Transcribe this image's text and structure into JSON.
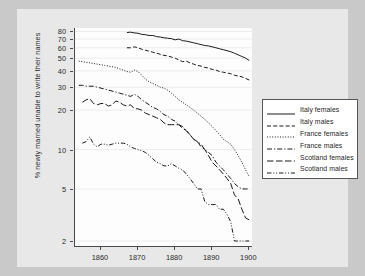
{
  "chart_data": {
    "type": "line",
    "title": "",
    "xlabel": "",
    "ylabel": "% newly married unable to write their names",
    "yscale": "log",
    "xlim": [
      1853,
      1901
    ],
    "ylim": [
      1.8,
      85
    ],
    "grid": "horizontal",
    "legend_position": "right",
    "x_ticks": [
      "1860",
      "1870",
      "1880",
      "1890",
      "1900"
    ],
    "x_tick_values": [
      1860,
      1870,
      1880,
      1890,
      1900
    ],
    "y_ticks": [
      "80",
      "70",
      "60",
      "50",
      "40",
      "30",
      "20",
      "10",
      "5",
      "2"
    ],
    "y_tick_values": [
      80,
      70,
      60,
      50,
      40,
      30,
      20,
      10,
      5,
      2
    ],
    "series": [
      {
        "name": "Italy females",
        "style": "solid",
        "x": [
          1867,
          1868,
          1869,
          1870,
          1871,
          1872,
          1873,
          1874,
          1875,
          1876,
          1877,
          1878,
          1879,
          1880,
          1881,
          1882,
          1883,
          1884,
          1885,
          1886,
          1887,
          1888,
          1889,
          1890,
          1891,
          1892,
          1893,
          1894,
          1895,
          1896,
          1897,
          1898,
          1899,
          1900
        ],
        "values": [
          78.5,
          79.0,
          78.0,
          77.5,
          76.0,
          75.5,
          74.5,
          74.5,
          73.0,
          72.5,
          71.5,
          71.0,
          70.5,
          69.0,
          70.0,
          68.0,
          67.5,
          66.5,
          65.5,
          64.5,
          63.5,
          62.5,
          62.0,
          61.0,
          60.0,
          59.0,
          58.0,
          57.0,
          56.0,
          54.5,
          53.0,
          51.5,
          50.0,
          48.0
        ]
      },
      {
        "name": "Italy males",
        "style": "dashed",
        "x": [
          1867,
          1868,
          1869,
          1870,
          1871,
          1872,
          1873,
          1874,
          1875,
          1876,
          1877,
          1878,
          1879,
          1880,
          1881,
          1882,
          1883,
          1884,
          1885,
          1886,
          1887,
          1888,
          1889,
          1890,
          1891,
          1892,
          1893,
          1894,
          1895,
          1896,
          1897,
          1898,
          1899,
          1900
        ],
        "values": [
          60.0,
          60.0,
          61.0,
          60.0,
          58.5,
          57.5,
          56.5,
          55.5,
          54.5,
          53.5,
          52.5,
          52.0,
          51.0,
          50.0,
          48.5,
          47.0,
          47.5,
          46.0,
          45.0,
          44.0,
          43.5,
          42.5,
          42.0,
          41.0,
          40.5,
          39.5,
          39.0,
          38.5,
          38.0,
          37.0,
          36.5,
          36.0,
          35.0,
          34.0
        ]
      },
      {
        "name": "France females",
        "style": "dotted",
        "x": [
          1854,
          1855,
          1856,
          1857,
          1858,
          1859,
          1860,
          1861,
          1862,
          1863,
          1864,
          1865,
          1866,
          1867,
          1868,
          1869,
          1870,
          1871,
          1872,
          1873,
          1874,
          1875,
          1876,
          1877,
          1878,
          1879,
          1880,
          1881,
          1882,
          1883,
          1884,
          1885,
          1886,
          1887,
          1888,
          1889,
          1890,
          1891,
          1892,
          1893,
          1894,
          1895,
          1896,
          1897,
          1898,
          1899,
          1900
        ],
        "values": [
          47.5,
          47.0,
          46.5,
          46.0,
          45.5,
          45.0,
          44.5,
          44.0,
          43.5,
          43.0,
          42.5,
          41.5,
          40.5,
          39.5,
          39.0,
          40.5,
          39.5,
          37.0,
          34.5,
          33.0,
          32.0,
          31.0,
          30.0,
          29.5,
          28.5,
          27.0,
          25.5,
          24.0,
          23.0,
          22.0,
          21.0,
          20.0,
          19.0,
          18.0,
          17.0,
          16.0,
          15.0,
          14.0,
          13.0,
          12.0,
          11.5,
          11.0,
          10.0,
          9.0,
          8.0,
          7.0,
          6.2
        ]
      },
      {
        "name": "France males",
        "style": "dashdot",
        "x": [
          1854,
          1855,
          1856,
          1857,
          1858,
          1859,
          1860,
          1861,
          1862,
          1863,
          1864,
          1865,
          1866,
          1867,
          1868,
          1869,
          1870,
          1871,
          1872,
          1873,
          1874,
          1875,
          1876,
          1877,
          1878,
          1879,
          1880,
          1881,
          1882,
          1883,
          1884,
          1885,
          1886,
          1887,
          1888,
          1889,
          1890,
          1891,
          1892,
          1893,
          1894,
          1895,
          1896,
          1897,
          1898,
          1899,
          1900
        ],
        "values": [
          31.0,
          31.0,
          30.5,
          30.5,
          30.5,
          30.0,
          29.5,
          29.0,
          28.5,
          28.0,
          27.5,
          27.0,
          26.5,
          26.0,
          25.5,
          26.5,
          25.5,
          24.0,
          23.0,
          22.0,
          21.0,
          20.5,
          19.5,
          18.5,
          18.0,
          17.0,
          16.5,
          15.5,
          15.0,
          14.0,
          13.0,
          12.0,
          11.5,
          11.0,
          10.0,
          9.5,
          9.0,
          8.0,
          7.5,
          7.0,
          6.5,
          6.0,
          5.5,
          5.2,
          5.0,
          5.0,
          5.0
        ]
      },
      {
        "name": "Scotland females",
        "style": "longdash",
        "x": [
          1855,
          1856,
          1857,
          1858,
          1859,
          1860,
          1861,
          1862,
          1863,
          1864,
          1865,
          1866,
          1867,
          1868,
          1869,
          1870,
          1871,
          1872,
          1873,
          1874,
          1875,
          1876,
          1877,
          1878,
          1879,
          1880,
          1881,
          1882,
          1883,
          1884,
          1885,
          1886,
          1887,
          1888,
          1889,
          1890,
          1891,
          1892,
          1893,
          1894,
          1895,
          1896,
          1897,
          1898,
          1899,
          1900
        ],
        "values": [
          23.0,
          24.0,
          24.5,
          22.5,
          22.0,
          22.5,
          22.5,
          21.5,
          22.0,
          23.5,
          23.0,
          22.0,
          21.5,
          22.0,
          20.5,
          20.5,
          20.0,
          19.0,
          18.5,
          18.0,
          17.5,
          17.0,
          16.0,
          15.5,
          15.5,
          15.5,
          15.5,
          14.5,
          14.0,
          13.0,
          12.0,
          11.5,
          10.5,
          10.0,
          9.0,
          8.0,
          7.5,
          7.0,
          6.5,
          6.0,
          5.5,
          4.5,
          4.2,
          3.5,
          3.0,
          2.9
        ]
      },
      {
        "name": "Scotland males",
        "style": "dashdotdot",
        "x": [
          1855,
          1856,
          1857,
          1858,
          1859,
          1860,
          1861,
          1862,
          1863,
          1864,
          1865,
          1866,
          1867,
          1868,
          1869,
          1870,
          1871,
          1872,
          1873,
          1874,
          1875,
          1876,
          1877,
          1878,
          1879,
          1880,
          1881,
          1882,
          1883,
          1884,
          1885,
          1886,
          1887,
          1888,
          1889,
          1890,
          1891,
          1892,
          1893,
          1894,
          1895,
          1896,
          1897,
          1898,
          1899,
          1900
        ],
        "values": [
          11.2,
          11.5,
          12.5,
          11.0,
          10.5,
          11.0,
          11.0,
          10.8,
          11.0,
          11.2,
          11.2,
          11.2,
          11.0,
          10.5,
          10.2,
          10.0,
          9.8,
          9.5,
          9.0,
          8.5,
          8.0,
          7.8,
          7.5,
          7.5,
          7.8,
          7.5,
          7.2,
          7.0,
          6.5,
          6.0,
          5.5,
          5.0,
          5.0,
          4.0,
          3.8,
          3.8,
          3.8,
          3.5,
          3.5,
          3.2,
          2.8,
          2.0,
          2.0,
          2.0,
          2.0,
          2.0
        ]
      }
    ]
  },
  "legend": {
    "items": [
      {
        "label": "Italy females",
        "style": "solid"
      },
      {
        "label": "Italy males",
        "style": "dashed"
      },
      {
        "label": "France females",
        "style": "dotted"
      },
      {
        "label": "France males",
        "style": "dashdot"
      },
      {
        "label": "Scotland females",
        "style": "longdash"
      },
      {
        "label": "Scotland males",
        "style": "dashdotdot"
      }
    ]
  },
  "colors": {
    "line": "#1a1a1a",
    "axis": "#4a4a4a",
    "grid": "#ececec",
    "plot_background": "#fdfdfd",
    "figure_background": "#e8e8e8",
    "page_background": "#c9c9c9",
    "text": "#2a2a2a"
  }
}
